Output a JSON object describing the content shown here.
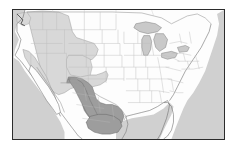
{
  "figure": {
    "kind": "distribution-map",
    "title": "",
    "caption": "",
    "frame": {
      "border_color": "#2b2b2b",
      "background_color": "#fdfdfd"
    }
  },
  "map": {
    "region_label": "North America",
    "extent": "Continental United States and northern Mexico",
    "projection_note": "",
    "land_fill": "#fefefe",
    "water_fill": "#cfcfcf",
    "coastline_color": "#6b6b6b",
    "state_boundary_color": "#b4b4b4",
    "country_boundary_color": "#8f8f8f"
  },
  "ranges": [
    {
      "name": "western-range",
      "label": "Western range (light shading)",
      "fill": "#d8d8d8",
      "stroke": "#9a9a9a",
      "area_description": "Pacific Northwest, Great Basin, Rocky Mountains, Sierra Nevada"
    },
    {
      "name": "mexican-range",
      "label": "Mexican range (dark shading)",
      "fill": "#9d9d9d",
      "stroke": "#6e6e6e",
      "area_description": "Sierra Madre Occidental and central Mexican highlands"
    }
  ],
  "legend": {
    "visible": false,
    "entries": []
  },
  "annotations": []
}
